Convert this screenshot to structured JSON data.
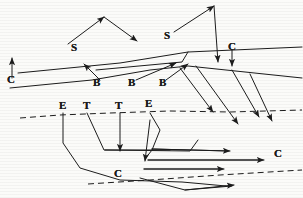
{
  "figure": {
    "type": "annotated-line-diagram",
    "width": 303,
    "height": 198,
    "background_color": "#fbfbf9",
    "ink_color": "#1c1c1c",
    "stroke_width": 1,
    "labels": [
      {
        "id": "label-s-1",
        "text": "S",
        "x": 71,
        "y": 42
      },
      {
        "id": "label-s-2",
        "text": "S",
        "x": 164,
        "y": 30
      },
      {
        "id": "label-c-1",
        "text": "C",
        "x": 7,
        "y": 74
      },
      {
        "id": "label-c-2",
        "text": "C",
        "x": 228,
        "y": 41
      },
      {
        "id": "label-b-1",
        "text": "B",
        "x": 93,
        "y": 77
      },
      {
        "id": "label-b-2",
        "text": "B",
        "x": 128,
        "y": 77
      },
      {
        "id": "label-b-3",
        "text": "B",
        "x": 159,
        "y": 77
      },
      {
        "id": "label-e-1",
        "text": "E",
        "x": 59,
        "y": 100
      },
      {
        "id": "label-t-1",
        "text": "T",
        "x": 83,
        "y": 100
      },
      {
        "id": "label-t-2",
        "text": "T",
        "x": 115,
        "y": 100
      },
      {
        "id": "label-e-2",
        "text": "E",
        "x": 145,
        "y": 98
      },
      {
        "id": "label-c-3",
        "text": "C",
        "x": 114,
        "y": 168
      },
      {
        "id": "label-c-4",
        "text": "C",
        "x": 274,
        "y": 148
      }
    ],
    "dashed_lines": [
      {
        "id": "dashed-horizon-upper",
        "points": "20,118 60,115 110,113 170,111 230,112 302,110"
      },
      {
        "id": "dashed-horizon-lower",
        "points": "88,184 150,180 220,175 302,170"
      }
    ],
    "solid_polylines": [
      {
        "id": "ridge-line-left",
        "points": "18,73 120,63 188,52 302,47"
      },
      {
        "id": "ridge-line-mid",
        "points": "10,88 92,80 150,70 188,66 302,78"
      },
      {
        "id": "box-upper-right",
        "points": "96,70 182,62 188,52"
      },
      {
        "id": "lower-left-spur",
        "points": "63,113 63,143 80,168 120,180 182,182 226,186"
      },
      {
        "id": "t1-descender",
        "points": "87,113 104,150 170,150"
      },
      {
        "id": "e2-descender",
        "points": "150,113 160,130 152,150 145,159"
      },
      {
        "id": "inner-box-bottom",
        "points": "105,150 190,151 198,140"
      },
      {
        "id": "lower-band-a",
        "points": "152,149 228,151"
      },
      {
        "id": "lower-band-b",
        "points": "148,160 262,160"
      },
      {
        "id": "lower-band-c",
        "points": "144,169 222,169"
      },
      {
        "id": "lower-band-d",
        "points": "140,178 185,190 232,186"
      }
    ],
    "arrows": [
      {
        "id": "arrow-s1-left",
        "from": "68,44",
        "to": "104,17"
      },
      {
        "id": "arrow-s1-right",
        "from": "104,17",
        "to": "137,41"
      },
      {
        "id": "arrow-s2-left",
        "from": "174,32",
        "to": "214,6"
      },
      {
        "id": "arrow-s2-down",
        "from": "214,6",
        "to": "218,62"
      },
      {
        "id": "arrow-c1-up",
        "from": "12,78",
        "to": "12,58"
      },
      {
        "id": "arrow-c2-down",
        "from": "232,50",
        "to": "232,66"
      },
      {
        "id": "arrow-b1-up",
        "from": "100,80",
        "to": "84,64"
      },
      {
        "id": "arrow-b2-up",
        "from": "136,80",
        "to": "176,63"
      },
      {
        "id": "arrow-b3-up",
        "from": "166,80",
        "to": "188,64"
      },
      {
        "id": "arrow-diag-1",
        "from": "180,68",
        "to": "213,112"
      },
      {
        "id": "arrow-diag-2",
        "from": "196,66",
        "to": "238,124"
      },
      {
        "id": "arrow-diag-3",
        "from": "232,70",
        "to": "259,117"
      },
      {
        "id": "arrow-diag-4",
        "from": "250,74",
        "to": "272,121"
      },
      {
        "id": "arrow-t2-down",
        "from": "120,113",
        "to": "120,151"
      },
      {
        "id": "arrow-e2-down",
        "from": "150,120",
        "to": "145,161"
      },
      {
        "id": "arrow-band-a",
        "from": "152,149",
        "to": "230,151"
      },
      {
        "id": "arrow-band-b",
        "from": "148,160",
        "to": "264,160"
      },
      {
        "id": "arrow-band-c",
        "from": "144,169",
        "to": "224,169"
      },
      {
        "id": "arrow-band-d",
        "from": "185,190",
        "to": "234,185"
      }
    ]
  }
}
